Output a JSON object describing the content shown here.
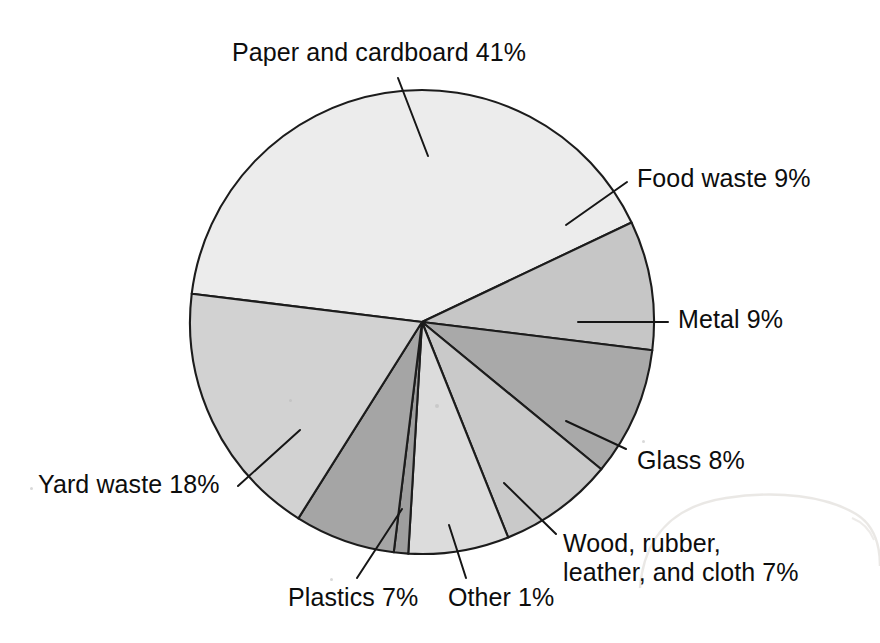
{
  "chart_data": {
    "type": "pie",
    "title": "",
    "subtitle": "",
    "xlabel": "",
    "ylabel": "",
    "legend_position": "none",
    "grid": false,
    "units": "percent",
    "total": 100,
    "start_angle_deg": 187,
    "direction": "counterclockwise-labels-clockwise-draw",
    "categories": [
      "Paper and cardboard",
      "Food waste",
      "Metal",
      "Glass",
      "Wood, rubber, leather, and cloth",
      "Other",
      "Plastics",
      "Yard waste"
    ],
    "values": [
      41,
      9,
      9,
      8,
      7,
      1,
      7,
      18
    ],
    "colors": [
      "#ececec",
      "#c6c6c6",
      "#a9a9a9",
      "#c9c9c9",
      "#dcdcdc",
      "#9e9e9e",
      "#a5a5a5",
      "#d2d2d2"
    ],
    "slices": [
      {
        "name": "Paper and cardboard",
        "value": 41,
        "label": "Paper and cardboard 41%",
        "color": "#ececec",
        "start_deg": 187,
        "end_deg": 334.6
      },
      {
        "name": "Food waste",
        "value": 9,
        "label": "Food waste 9%",
        "color": "#c6c6c6",
        "start_deg": 334.6,
        "end_deg": 367.0
      },
      {
        "name": "Metal",
        "value": 9,
        "label": "Metal 9%",
        "color": "#a9a9a9",
        "start_deg": 367.0,
        "end_deg": 399.4
      },
      {
        "name": "Glass",
        "value": 8,
        "label": "Glass 8%",
        "color": "#c9c9c9",
        "start_deg": 399.4,
        "end_deg": 428.2
      },
      {
        "name": "Wood, rubber, leather, and cloth",
        "value": 7,
        "label": "Wood, rubber, leather, and cloth 7%",
        "color": "#dcdcdc",
        "start_deg": 428.2,
        "end_deg": 453.4
      },
      {
        "name": "Other",
        "value": 1,
        "label": "Other 1%",
        "color": "#9e9e9e",
        "start_deg": 453.4,
        "end_deg": 457.0
      },
      {
        "name": "Plastics",
        "value": 7,
        "label": "Plastics 7%",
        "color": "#a5a5a5",
        "start_deg": 457.0,
        "end_deg": 482.2
      },
      {
        "name": "Yard waste",
        "value": 18,
        "label": "Yard waste 18%",
        "color": "#d2d2d2",
        "start_deg": 482.2,
        "end_deg": 547.0
      }
    ]
  },
  "geometry": {
    "center_x": 422,
    "center_y": 322,
    "radius": 232,
    "stroke_color": "#1c1c1c"
  },
  "labels": {
    "paper": "Paper and cardboard 41%",
    "food": "Food waste 9%",
    "metal": "Metal 9%",
    "glass": "Glass 8%",
    "wood_line1": "Wood, rubber,",
    "wood_line2": "leather, and cloth 7%",
    "plastics": "Plastics 7%",
    "other": "Other 1%",
    "yard": "Yard waste 18%"
  }
}
